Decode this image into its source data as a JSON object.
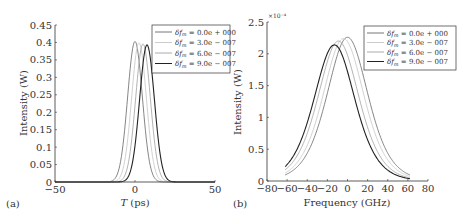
{
  "chart_data": [
    {
      "panel": "(a)",
      "type": "line",
      "title": "",
      "xlabel": "T (ps)",
      "ylabel": "Intensity (W)",
      "xlim": [
        -50,
        50
      ],
      "ylim": [
        0,
        0.45
      ],
      "xticks": [
        "-50",
        "0",
        "50"
      ],
      "yticks": [
        "0",
        "0.05",
        "0.1",
        "0.15",
        "0.2",
        "0.25",
        "0.3",
        "0.35",
        "0.4",
        "0.45"
      ],
      "legend_position": "upper right",
      "grid": false,
      "series": [
        {
          "name": "δf_m = 0.0e + 000",
          "color": "#777777",
          "peak_x": 0,
          "peak_y": 0.403,
          "width": 6.5
        },
        {
          "name": "δf_m = 3.0e − 007",
          "color": "#cccccc",
          "peak_x": 2.5,
          "peak_y": 0.399,
          "width": 6.5
        },
        {
          "name": "δf_m = 6.0e − 007",
          "color": "#aaaaaa",
          "peak_x": 5,
          "peak_y": 0.396,
          "width": 6.5
        },
        {
          "name": "δf_m = 9.0e − 007",
          "color": "#222222",
          "peak_x": 7.5,
          "peak_y": 0.393,
          "width": 6.5
        }
      ]
    },
    {
      "panel": "(b)",
      "type": "line",
      "title": "",
      "xlabel": "Frequency (GHz)",
      "ylabel": "Intensity (W)",
      "y_exponent": "×10⁻⁴",
      "xlim": [
        -80,
        80
      ],
      "ylim": [
        0,
        2.5
      ],
      "xticks": [
        "-80",
        "-60",
        "-40",
        "-20",
        "0",
        "20",
        "40",
        "60",
        "80"
      ],
      "yticks": [
        "0",
        "0.5",
        "1",
        "1.5",
        "2",
        "2.5"
      ],
      "legend_position": "upper right",
      "grid": false,
      "x_range_data": [
        -62,
        62
      ],
      "series": [
        {
          "name": "δf_m = 0.0e + 000",
          "color": "#777777",
          "peak_x": 0,
          "peak_y": 2.26,
          "width": 26
        },
        {
          "name": "δf_m = 3.0e − 007",
          "color": "#cccccc",
          "peak_x": -4,
          "peak_y": 2.24,
          "width": 26
        },
        {
          "name": "δf_m = 6.0e − 007",
          "color": "#aaaaaa",
          "peak_x": -9,
          "peak_y": 2.2,
          "width": 26
        },
        {
          "name": "δf_m = 9.0e − 007",
          "color": "#222222",
          "peak_x": -13,
          "peak_y": 2.14,
          "width": 26
        }
      ]
    }
  ],
  "labels": {
    "a": {
      "panel": "(a)",
      "ylabel": "Intensity (W)",
      "xlabel_italic": "T",
      "xlabel_rest": " (ps)"
    },
    "b": {
      "panel": "(b)",
      "ylabel": "Intensity (W)",
      "xlabel": "Frequency (GHz)",
      "exponent": "×10⁻⁴"
    }
  }
}
